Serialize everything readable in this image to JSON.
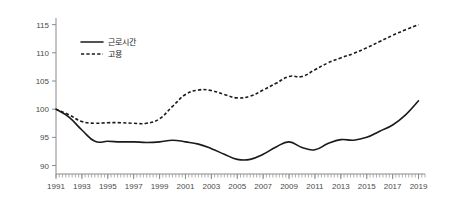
{
  "chart_data": {
    "type": "line",
    "title": "",
    "subtitle": "",
    "xlabel": "",
    "ylabel": "",
    "xlim": [
      1991,
      2019.5
    ],
    "ylim": [
      88.5,
      116
    ],
    "grid": false,
    "legend_position": "top-left",
    "index_base": "1991 = 100",
    "y_ticks": [
      90,
      95,
      100,
      105,
      110,
      115
    ],
    "x_ticks": [
      1991,
      1993,
      1995,
      1997,
      1999,
      2001,
      2003,
      2005,
      2007,
      2009,
      2011,
      2013,
      2015,
      2017,
      2019
    ],
    "x_minor_step": 0.25,
    "x": [
      1991,
      1992,
      1993,
      1994,
      1995,
      1996,
      1997,
      1998,
      1999,
      2000,
      2001,
      2002,
      2003,
      2004,
      2005,
      2006,
      2007,
      2008,
      2009,
      2010,
      2011,
      2012,
      2013,
      2014,
      2015,
      2016,
      2017,
      2018,
      2019
    ],
    "series": [
      {
        "name": "근로시간",
        "style": "solid",
        "color": "#1a1a1a",
        "values": [
          100.0,
          98.6,
          96.3,
          94.3,
          94.3,
          94.2,
          94.2,
          94.1,
          94.2,
          94.5,
          94.2,
          93.8,
          93.0,
          92.0,
          91.1,
          91.1,
          92.0,
          93.3,
          94.2,
          93.2,
          92.8,
          93.9,
          94.6,
          94.5,
          95.0,
          96.1,
          97.2,
          99.0,
          101.5
        ]
      },
      {
        "name": "고용",
        "style": "dashed",
        "color": "#1a1a1a",
        "values": [
          100.0,
          99.0,
          97.8,
          97.5,
          97.6,
          97.6,
          97.5,
          97.5,
          98.3,
          100.5,
          102.6,
          103.4,
          103.3,
          102.6,
          102.0,
          102.3,
          103.4,
          104.6,
          105.8,
          105.8,
          107.0,
          108.2,
          109.1,
          109.9,
          110.9,
          112.0,
          113.1,
          114.1,
          115.0
        ]
      }
    ]
  },
  "legend": {
    "entries": [
      {
        "label": "근로시간",
        "style": "solid"
      },
      {
        "label": "고용",
        "style": "dashed"
      }
    ]
  },
  "axes": {
    "y_tick_labels": [
      "115",
      "110",
      "105",
      "100",
      "95",
      "90"
    ],
    "x_tick_labels": [
      "1991",
      "1993",
      "1995",
      "1997",
      "1999",
      "2001",
      "2003",
      "2005",
      "2007",
      "2009",
      "2011",
      "2013",
      "2015",
      "2017",
      "2019"
    ]
  }
}
